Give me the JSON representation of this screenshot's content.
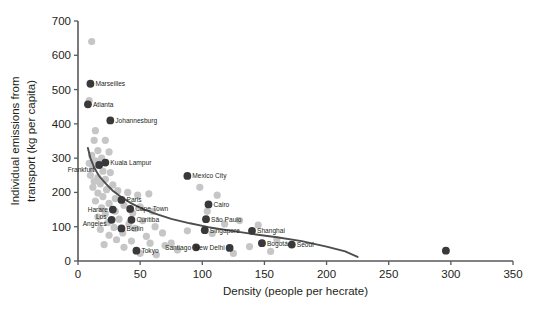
{
  "chart_data": {
    "type": "scatter",
    "title": "",
    "xlabel": "Density (people per hecrate)",
    "ylabel": "Individual emissions from transport (kg per capita)",
    "xlim": [
      0,
      350
    ],
    "ylim": [
      0,
      700
    ],
    "xticks": [
      0,
      50,
      100,
      150,
      200,
      250,
      300,
      350
    ],
    "yticks": [
      0,
      100,
      200,
      300,
      400,
      500,
      600,
      700
    ],
    "grid": false,
    "legend": "none",
    "trend_line": {
      "description": "decaying fitted curve",
      "points": [
        [
          8,
          330
        ],
        [
          10,
          300
        ],
        [
          13,
          272
        ],
        [
          17,
          248
        ],
        [
          22,
          227
        ],
        [
          28,
          205
        ],
        [
          35,
          186
        ],
        [
          43,
          168
        ],
        [
          52,
          152
        ],
        [
          62,
          138
        ],
        [
          75,
          123
        ],
        [
          90,
          110
        ],
        [
          105,
          99
        ],
        [
          120,
          90
        ],
        [
          140,
          79
        ],
        [
          160,
          69
        ],
        [
          180,
          58
        ],
        [
          200,
          42
        ],
        [
          215,
          28
        ],
        [
          225,
          12
        ]
      ]
    },
    "series": [
      {
        "name": "Labeled cities",
        "marker": "dark-circle",
        "color": "#39383a",
        "points": [
          {
            "label": "Marseilles",
            "x": 10,
            "y": 517
          },
          {
            "label": "Atlanta",
            "x": 8,
            "y": 457
          },
          {
            "label": "Johannesburg",
            "x": 26,
            "y": 410
          },
          {
            "label": "Kuala Lampur",
            "x": 22,
            "y": 287
          },
          {
            "label": "Frankfurt",
            "x": 17,
            "y": 280
          },
          {
            "label": "Mexico City",
            "x": 88,
            "y": 248
          },
          {
            "label": "Paris",
            "x": 35,
            "y": 178
          },
          {
            "label": "Cairo",
            "x": 105,
            "y": 165
          },
          {
            "label": "Cape Town",
            "x": 42,
            "y": 152
          },
          {
            "label": "Harare",
            "x": 28,
            "y": 150
          },
          {
            "label": "São Paulo",
            "x": 103,
            "y": 122
          },
          {
            "label": "Los Angeles",
            "x": 27,
            "y": 120
          },
          {
            "label": "Curitiba",
            "x": 43,
            "y": 120
          },
          {
            "label": "Berlin",
            "x": 35,
            "y": 95
          },
          {
            "label": "Singapore",
            "x": 102,
            "y": 90
          },
          {
            "label": "Shanghai",
            "x": 140,
            "y": 88
          },
          {
            "label": "Bogotá",
            "x": 148,
            "y": 52
          },
          {
            "label": "Seoul",
            "x": 172,
            "y": 48
          },
          {
            "label": "Santiago",
            "x": 95,
            "y": 40
          },
          {
            "label": "New Delhi",
            "x": 122,
            "y": 38
          },
          {
            "label": "Tokyo",
            "x": 47,
            "y": 30
          },
          {
            "label": "",
            "x": 296,
            "y": 30
          }
        ]
      },
      {
        "name": "Unlabeled cities",
        "marker": "light-circle",
        "color": "#c6c6c6",
        "points": [
          {
            "x": 11,
            "y": 640
          },
          {
            "x": 9,
            "y": 468
          },
          {
            "x": 14,
            "y": 380
          },
          {
            "x": 13,
            "y": 352
          },
          {
            "x": 22,
            "y": 352
          },
          {
            "x": 16,
            "y": 322
          },
          {
            "x": 25,
            "y": 318
          },
          {
            "x": 11,
            "y": 308
          },
          {
            "x": 19,
            "y": 300
          },
          {
            "x": 14,
            "y": 292
          },
          {
            "x": 9,
            "y": 285
          },
          {
            "x": 12,
            "y": 270
          },
          {
            "x": 20,
            "y": 262
          },
          {
            "x": 26,
            "y": 258
          },
          {
            "x": 10,
            "y": 250
          },
          {
            "x": 16,
            "y": 243
          },
          {
            "x": 22,
            "y": 238
          },
          {
            "x": 13,
            "y": 232
          },
          {
            "x": 18,
            "y": 225
          },
          {
            "x": 28,
            "y": 222
          },
          {
            "x": 12,
            "y": 215
          },
          {
            "x": 23,
            "y": 208
          },
          {
            "x": 32,
            "y": 205
          },
          {
            "x": 16,
            "y": 198
          },
          {
            "x": 40,
            "y": 200
          },
          {
            "x": 20,
            "y": 188
          },
          {
            "x": 30,
            "y": 182
          },
          {
            "x": 48,
            "y": 192
          },
          {
            "x": 57,
            "y": 196
          },
          {
            "x": 14,
            "y": 175
          },
          {
            "x": 25,
            "y": 168
          },
          {
            "x": 37,
            "y": 162
          },
          {
            "x": 19,
            "y": 155
          },
          {
            "x": 50,
            "y": 158
          },
          {
            "x": 30,
            "y": 145
          },
          {
            "x": 22,
            "y": 138
          },
          {
            "x": 44,
            "y": 140
          },
          {
            "x": 60,
            "y": 145
          },
          {
            "x": 16,
            "y": 128
          },
          {
            "x": 33,
            "y": 122
          },
          {
            "x": 52,
            "y": 118
          },
          {
            "x": 24,
            "y": 112
          },
          {
            "x": 41,
            "y": 108
          },
          {
            "x": 29,
            "y": 98
          },
          {
            "x": 18,
            "y": 92
          },
          {
            "x": 46,
            "y": 95
          },
          {
            "x": 62,
            "y": 100
          },
          {
            "x": 36,
            "y": 82
          },
          {
            "x": 25,
            "y": 75
          },
          {
            "x": 55,
            "y": 72
          },
          {
            "x": 68,
            "y": 82
          },
          {
            "x": 31,
            "y": 62
          },
          {
            "x": 43,
            "y": 58
          },
          {
            "x": 58,
            "y": 52
          },
          {
            "x": 21,
            "y": 48
          },
          {
            "x": 70,
            "y": 45
          },
          {
            "x": 37,
            "y": 40
          },
          {
            "x": 50,
            "y": 22
          },
          {
            "x": 63,
            "y": 18
          },
          {
            "x": 80,
            "y": 32
          },
          {
            "x": 98,
            "y": 215
          },
          {
            "x": 112,
            "y": 192
          },
          {
            "x": 104,
            "y": 145
          },
          {
            "x": 118,
            "y": 108
          },
          {
            "x": 130,
            "y": 118
          },
          {
            "x": 145,
            "y": 105
          },
          {
            "x": 88,
            "y": 88
          },
          {
            "x": 108,
            "y": 80
          },
          {
            "x": 160,
            "y": 62
          },
          {
            "x": 138,
            "y": 42
          },
          {
            "x": 125,
            "y": 22
          },
          {
            "x": 155,
            "y": 28
          },
          {
            "x": 75,
            "y": 52
          }
        ]
      }
    ]
  }
}
